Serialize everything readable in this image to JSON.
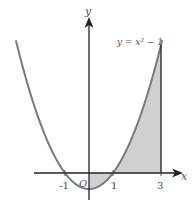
{
  "chart_data": {
    "type": "line",
    "title": "",
    "function_label": "y = x² − 1",
    "xlabel": "x",
    "ylabel": "y",
    "origin_label": "O",
    "x_ticks": [
      {
        "value": -1,
        "label": "-1"
      },
      {
        "value": 1,
        "label": "1"
      },
      {
        "value": 3,
        "label": "3"
      }
    ],
    "series": [
      {
        "name": "y = x^2 - 1",
        "x": [
          -3.05,
          -2,
          -1,
          0,
          1,
          2,
          3,
          3.05
        ],
        "y": [
          8.3,
          3,
          0,
          -1,
          0,
          3,
          8,
          8.3
        ]
      }
    ],
    "shaded_region": {
      "from_x": 0,
      "to_x": 3,
      "description": "area between curve and x-axis from x=0 to x=3"
    },
    "xlim": [
      -3.2,
      3.6
    ],
    "ylim": [
      -1.6,
      9.6
    ],
    "grid": false,
    "colors": {
      "curve": "#7a7a7a",
      "axes": "#222222",
      "shade": "#d0d0d0"
    }
  }
}
